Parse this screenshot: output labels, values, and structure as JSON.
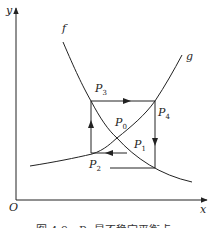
{
  "figure": {
    "axes": {
      "y_label": "y",
      "x_label": "x",
      "origin_label": "O"
    },
    "curves": [
      {
        "name": "f",
        "label": "f"
      },
      {
        "name": "g",
        "label": "g"
      }
    ],
    "points": {
      "p0": {
        "base": "P",
        "sub": "0"
      },
      "p1": {
        "base": "P",
        "sub": "1"
      },
      "p2": {
        "base": "P",
        "sub": "2"
      },
      "p3": {
        "base": "P",
        "sub": "3"
      },
      "p4": {
        "base": "P",
        "sub": "4"
      }
    },
    "caption": "图 4.9　P₀ 是不稳定平衡点"
  },
  "colors": {
    "stroke": "#222222",
    "background": "#ffffff"
  }
}
